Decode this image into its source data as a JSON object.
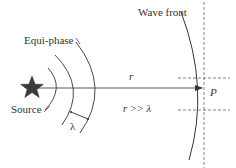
{
  "diagram": {
    "labels": {
      "equi_phase": "Equi-phase",
      "wave_front": "Wave front",
      "source": "Source",
      "distance": "r",
      "far_field_condition": "r >> λ",
      "wavelength": "λ",
      "observation_point": "P"
    },
    "elements": {
      "source_icon": "star-icon",
      "equi_phase_arc_count": 3
    },
    "colors": {
      "stroke": "#333333",
      "source_fill": "#3a3a3a",
      "dashed": "#555555",
      "background": "#ffffff"
    }
  }
}
